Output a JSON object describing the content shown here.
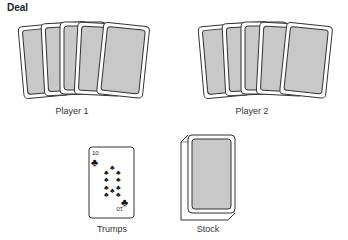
{
  "title": "Deal",
  "hands": [
    {
      "label": "Player 1",
      "card_count": 5
    },
    {
      "label": "Player 2",
      "card_count": 5
    }
  ],
  "trumps": {
    "label": "Trumps",
    "rank": "10",
    "suit": "clubs",
    "suit_glyph": "♣"
  },
  "stock": {
    "label": "Stock"
  },
  "colors": {
    "card_back": "#c8c8c8",
    "card_border": "#333333"
  }
}
